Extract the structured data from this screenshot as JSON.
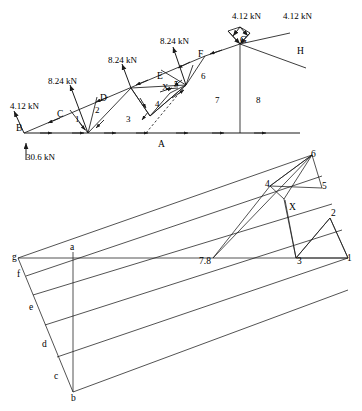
{
  "figure": {
    "stroke_color": "#1a1a1a",
    "text_color": "#000000"
  },
  "truss": {
    "loads": [
      {
        "id": "load-b",
        "label": "4.12 kN",
        "x": 10,
        "y": 102
      },
      {
        "id": "load-c",
        "label": "8.24 kN",
        "x": 48,
        "y": 77
      },
      {
        "id": "load-d",
        "label": "8.24 kN",
        "x": 108,
        "y": 56
      },
      {
        "id": "load-e",
        "label": "8.24 kN",
        "x": 160,
        "y": 37
      },
      {
        "id": "load-g1",
        "label": "4.12 kN",
        "x": 232,
        "y": 12
      },
      {
        "id": "load-g2",
        "label": "4.12 kN",
        "x": 283,
        "y": 12
      }
    ],
    "reaction": {
      "label": "30.6 kN",
      "x": 26,
      "y": 153
    },
    "external_nodes": [
      {
        "id": "node-b",
        "label": "B",
        "x": 16,
        "y": 124
      },
      {
        "id": "node-c",
        "label": "C",
        "x": 57,
        "y": 110
      },
      {
        "id": "node-d",
        "label": "D",
        "x": 100,
        "y": 94
      },
      {
        "id": "node-e",
        "label": "E",
        "x": 157,
        "y": 72
      },
      {
        "id": "node-f",
        "label": "F",
        "x": 198,
        "y": 50
      },
      {
        "id": "node-g",
        "label": "G",
        "x": 240,
        "y": 36
      },
      {
        "id": "node-h",
        "label": "H",
        "x": 297,
        "y": 47
      },
      {
        "id": "node-a",
        "label": "A",
        "x": 158,
        "y": 140
      }
    ],
    "panel_numbers": [
      {
        "id": "panel-1",
        "label": "1",
        "x": 75,
        "y": 115
      },
      {
        "id": "panel-2",
        "label": "2",
        "x": 95,
        "y": 106
      },
      {
        "id": "panel-3",
        "label": "3",
        "x": 126,
        "y": 115
      },
      {
        "id": "panel-4",
        "label": "4",
        "x": 155,
        "y": 100
      },
      {
        "id": "panel-5",
        "label": "5",
        "x": 174,
        "y": 80
      },
      {
        "id": "panel-6",
        "label": "6",
        "x": 201,
        "y": 72
      },
      {
        "id": "panel-7",
        "label": "7",
        "x": 215,
        "y": 96
      },
      {
        "id": "panel-8",
        "label": "8",
        "x": 256,
        "y": 96
      },
      {
        "id": "panel-x",
        "label": "X",
        "x": 162,
        "y": 83
      }
    ]
  },
  "maxwell": {
    "labels": [
      {
        "id": "pt-6",
        "label": "6",
        "x": 311,
        "y": 150
      },
      {
        "id": "pt-4",
        "label": "4",
        "x": 265,
        "y": 180
      },
      {
        "id": "pt-5",
        "label": "5",
        "x": 322,
        "y": 182
      },
      {
        "id": "pt-x",
        "label": "X",
        "x": 289,
        "y": 203
      },
      {
        "id": "pt-2",
        "label": "2",
        "x": 331,
        "y": 209
      },
      {
        "id": "pt-1",
        "label": "1",
        "x": 347,
        "y": 254
      },
      {
        "id": "pt-3",
        "label": "3",
        "x": 297,
        "y": 257
      },
      {
        "id": "pt-78",
        "label": "7.8",
        "x": 199,
        "y": 257
      },
      {
        "id": "pt-a",
        "label": "a",
        "x": 70,
        "y": 243
      },
      {
        "id": "pt-g",
        "label": "g",
        "x": 12,
        "y": 253
      },
      {
        "id": "pt-f",
        "label": "f",
        "x": 17,
        "y": 270
      },
      {
        "id": "pt-e",
        "label": "e",
        "x": 29,
        "y": 303
      },
      {
        "id": "pt-d",
        "label": "d",
        "x": 42,
        "y": 340
      },
      {
        "id": "pt-c",
        "label": "c",
        "x": 54,
        "y": 372
      },
      {
        "id": "pt-b",
        "label": "b",
        "x": 71,
        "y": 394
      }
    ]
  }
}
